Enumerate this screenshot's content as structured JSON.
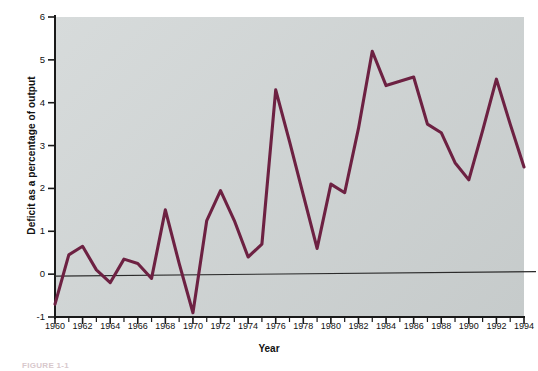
{
  "figure": {
    "caption": "FIGURE 1-1"
  },
  "chart_data": {
    "type": "line",
    "title": "",
    "xlabel": "Year",
    "ylabel": "Deficit as a percentage of output",
    "xlim": [
      1960,
      1994
    ],
    "ylim": [
      -1,
      6
    ],
    "grid": false,
    "legend": false,
    "zero_line": true,
    "line_color": "#6d2142",
    "plot_background": "#ced3d3",
    "y_ticks": [
      6,
      5,
      4,
      3,
      2,
      1,
      0,
      -1
    ],
    "y_tick_labels": [
      "6",
      "5",
      "4",
      "3",
      "2",
      "1",
      "0",
      "-1"
    ],
    "x_ticks": [
      1960,
      1962,
      1964,
      1966,
      1968,
      1970,
      1972,
      1974,
      1976,
      1978,
      1980,
      1982,
      1984,
      1986,
      1988,
      1990,
      1992,
      1994
    ],
    "x_tick_labels": [
      "1960",
      "1962",
      "1964",
      "1966",
      "1968",
      "1970",
      "1972",
      "1974",
      "1976",
      "1978",
      "1980",
      "1982",
      "1984",
      "1986",
      "1988",
      "1990",
      "1992",
      "1994"
    ],
    "x_minor_ticks": [
      1961,
      1963,
      1965,
      1967,
      1969,
      1971,
      1973,
      1975,
      1977,
      1979,
      1981,
      1983,
      1985,
      1987,
      1989,
      1991,
      1993
    ],
    "x": [
      1960,
      1961,
      1962,
      1963,
      1964,
      1965,
      1966,
      1967,
      1968,
      1969,
      1970,
      1971,
      1972,
      1973,
      1974,
      1975,
      1976,
      1977,
      1978,
      1979,
      1980,
      1981,
      1982,
      1983,
      1984,
      1985,
      1986,
      1987,
      1988,
      1989,
      1990,
      1991,
      1992,
      1993,
      1994
    ],
    "values": [
      -0.7,
      0.45,
      0.65,
      0.1,
      -0.2,
      0.35,
      0.25,
      -0.1,
      1.5,
      0.25,
      -0.9,
      1.25,
      1.95,
      1.25,
      0.4,
      0.7,
      4.3,
      3.1,
      1.85,
      0.6,
      2.1,
      1.9,
      3.4,
      5.2,
      4.4,
      4.5,
      4.6,
      3.5,
      3.3,
      2.6,
      2.2,
      3.35,
      4.55,
      3.5,
      2.5
    ],
    "series_name": "Deficit as a percentage of output"
  }
}
